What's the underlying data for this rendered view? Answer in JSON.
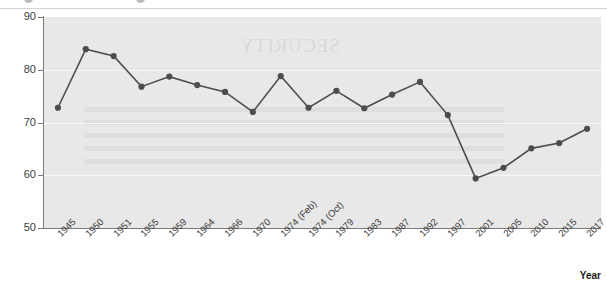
{
  "header": {
    "bullets": [
      "bullet-one",
      "bullet-two"
    ]
  },
  "watermark": {
    "text": "SECURITY"
  },
  "chart_data": {
    "type": "line",
    "title": "",
    "subtitle": "",
    "xlabel": "Year",
    "ylabel": "Turnout (%)",
    "ylim": [
      50,
      90
    ],
    "yticks": [
      50,
      60,
      70,
      80,
      90
    ],
    "grid": true,
    "legend": "none",
    "marker": "circle",
    "series_color": "#4d4d4d",
    "plot_background": "#e8e8e8",
    "categories": [
      "1945",
      "1950",
      "1951",
      "1955",
      "1959",
      "1964",
      "1966",
      "1970",
      "1974 (Feb)",
      "1974 (Oct)",
      "1979",
      "1983",
      "1987",
      "1992",
      "1997",
      "2001",
      "2005",
      "2010",
      "2015",
      "2017"
    ],
    "values": [
      72.8,
      83.9,
      82.6,
      76.8,
      78.7,
      77.1,
      75.8,
      72.0,
      78.8,
      72.8,
      76.0,
      72.7,
      75.3,
      77.7,
      71.4,
      59.4,
      61.4,
      65.1,
      66.1,
      68.8
    ]
  }
}
